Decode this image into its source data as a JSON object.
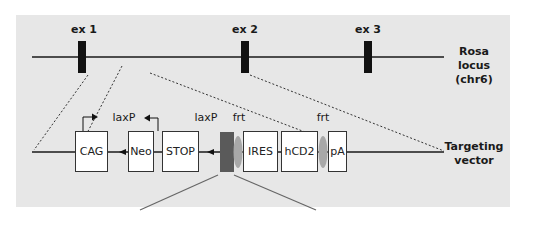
{
  "locus": {
    "label_line1": "Rosa locus",
    "label_line2": "(chr6)",
    "exons": [
      {
        "label": "ex 1"
      },
      {
        "label": "ex 2"
      },
      {
        "label": "ex 3"
      }
    ]
  },
  "vector": {
    "label_line1": "Targeting",
    "label_line2": "vector",
    "elements": [
      {
        "label": "CAG"
      },
      {
        "label": "Neo"
      },
      {
        "label": "STOP"
      },
      {
        "label": "IRES"
      },
      {
        "label": "hCD2"
      },
      {
        "label": "pA"
      }
    ],
    "site_labels": {
      "loxp1": "laxP",
      "loxp2": "laxP",
      "frt1": "frt",
      "frt2": "frt"
    }
  },
  "colors": {
    "panel_bg": "#e7e7e7",
    "line": "#1a1a1a",
    "exon": "#111111",
    "insert_block": "#5a5a5a",
    "frt_site": "#a8a8a8"
  }
}
